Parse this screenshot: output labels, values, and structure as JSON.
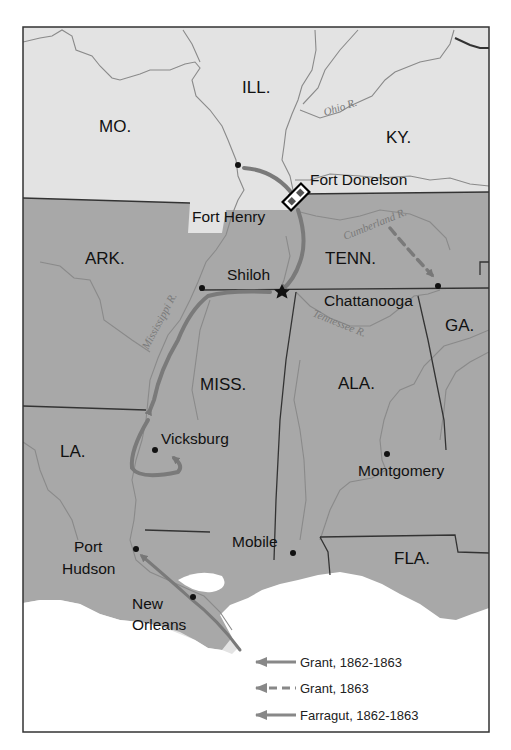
{
  "map": {
    "colors": {
      "union": "#e3e3e3",
      "confederate": "#a8a8a8",
      "water": "#ffffff",
      "border": "#333333",
      "river": "#8a8a8a",
      "route": "#777777"
    },
    "states": {
      "mo": "MO.",
      "ill": "ILL.",
      "ky": "KY.",
      "ark": "ARK.",
      "tenn": "TENN.",
      "ga": "GA.",
      "miss": "MISS.",
      "ala": "ALA.",
      "la": "LA.",
      "fla": "FLA."
    },
    "rivers": {
      "ohio": "Ohio R.",
      "cumberland": "Cumberland R.",
      "mississippi": "Mississippi R.",
      "tennessee": "Tennessee R."
    },
    "cities": {
      "fort_donelson": "Fort Donelson",
      "fort_henry": "Fort Henry",
      "shiloh": "Shiloh",
      "chattanooga": "Chattanooga",
      "vicksburg": "Vicksburg",
      "montgomery": "Montgomery",
      "mobile": "Mobile",
      "port_hudson_1": "Port",
      "port_hudson_2": "Hudson",
      "new_orleans_1": "New",
      "new_orleans_2": "Orleans"
    },
    "legend": [
      {
        "label": "Grant, 1862-1863",
        "style": "solid"
      },
      {
        "label": "Grant, 1863",
        "style": "dashed"
      },
      {
        "label": "Farragut, 1862-1863",
        "style": "solid-thin"
      }
    ]
  }
}
